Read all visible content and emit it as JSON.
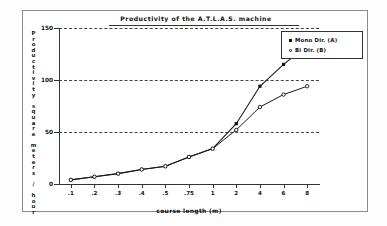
{
  "chart_data": {
    "type": "line",
    "title": "Productivity of the  A.T.L.A.S.  machine",
    "xlabel": "course length (m)",
    "ylabel": "Productivity square meters / hour",
    "categories": [
      ".1",
      ".2",
      ".3",
      ".4",
      ".5",
      ".75",
      "1",
      "2",
      "4",
      "6",
      "8"
    ],
    "x_is_categorical": true,
    "ylim": [
      0,
      150
    ],
    "yticks": [
      0,
      50,
      100,
      150
    ],
    "ytick_labels": [
      "0",
      "50",
      "100",
      "150"
    ],
    "grid": "horizontal-dashed",
    "legend_position": "top-right",
    "series": [
      {
        "name": "Mono Dir. (A)",
        "marker": "filled-square",
        "values": [
          4,
          7,
          10,
          14,
          17,
          26,
          34,
          58,
          94,
          115,
          133
        ]
      },
      {
        "name": "Bi  Dir. (B)",
        "marker": "open-circle",
        "values": [
          4,
          7,
          10,
          14,
          17,
          26,
          34,
          52,
          74,
          86,
          94
        ]
      }
    ]
  },
  "legend": {
    "entries": [
      {
        "label": "Mono Dir. (A)",
        "marker": "filled-square"
      },
      {
        "label": "Bi    Dir. (B)",
        "marker": "open-circle"
      }
    ]
  }
}
